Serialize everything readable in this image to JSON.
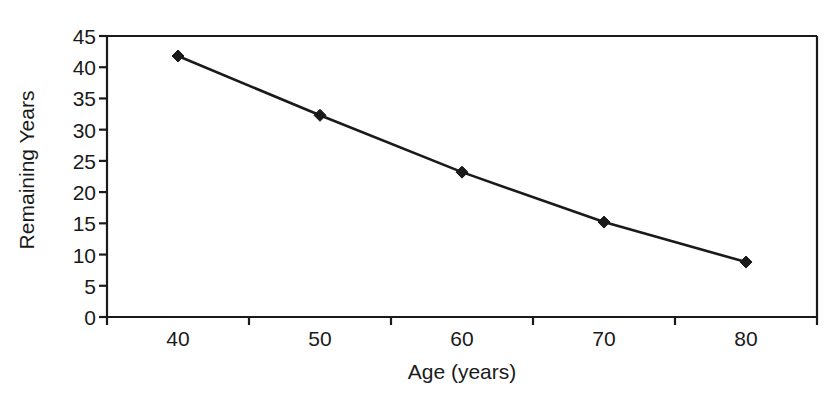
{
  "chart_data": {
    "type": "line",
    "title": "",
    "xlabel": "Age (years)",
    "ylabel": "Remaining Years",
    "categories": [
      "40",
      "50",
      "60",
      "70",
      "80"
    ],
    "x": [
      40,
      50,
      60,
      70,
      80
    ],
    "values": [
      41.8,
      32.3,
      23.2,
      15.2,
      8.8
    ],
    "series": [
      {
        "name": "Remaining Years",
        "values": [
          41.8,
          32.3,
          23.2,
          15.2,
          8.8
        ]
      }
    ],
    "ylim": [
      0,
      45
    ],
    "ytick_labels": [
      "0",
      "5",
      "10",
      "15",
      "20",
      "25",
      "30",
      "35",
      "40",
      "45"
    ],
    "ytick_values": [
      0,
      5,
      10,
      15,
      20,
      25,
      30,
      35,
      40,
      45
    ],
    "xtick_labels": [
      "40",
      "50",
      "60",
      "70",
      "80"
    ],
    "grid": false,
    "legend": false,
    "marker": "diamond",
    "line_color": "#1a1a1a",
    "marker_color": "#1a1a1a",
    "axis_color": "#1a1a1a",
    "background_color": "#ffffff"
  }
}
